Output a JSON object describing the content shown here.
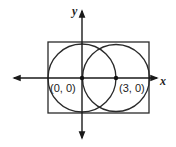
{
  "diagram": {
    "type": "coordinate-geometry",
    "axes": {
      "x_label": "x",
      "y_label": "y"
    },
    "points": [
      {
        "label": "(0, 0)",
        "x": 0,
        "y": 0
      },
      {
        "label": "(3, 0)",
        "x": 3,
        "y": 0
      }
    ],
    "shapes": [
      {
        "kind": "circle",
        "center": "(0, 0)",
        "radius": 3
      },
      {
        "kind": "circle",
        "center": "(3, 0)",
        "radius": 3
      },
      {
        "kind": "rectangle",
        "description": "circumscribes both circles"
      }
    ],
    "colors": {
      "stroke": "#2a2a2a",
      "background": "#ffffff"
    }
  }
}
